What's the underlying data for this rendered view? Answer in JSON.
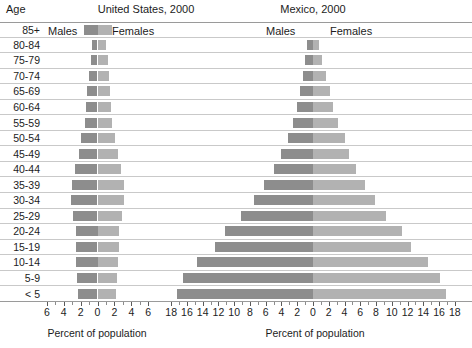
{
  "header": {
    "age_axis_label": "Age",
    "us_title": "United States, 2000",
    "mx_title": "Mexico, 2000",
    "legend": {
      "us_males": "Males",
      "us_females": "Females",
      "mx_males": "Males",
      "mx_females": "Females"
    }
  },
  "footer": {
    "us_caption": "Percent of population",
    "mx_caption": "Percent of population"
  },
  "chart_data": {
    "type": "bar",
    "subtype": "population-pyramid",
    "xlabel": "Percent of population",
    "ylabel": "Age",
    "grid": true,
    "legend_position": "top",
    "categories": [
      "85+",
      "80-84",
      "75-79",
      "70-74",
      "65-69",
      "60-64",
      "55-59",
      "50-54",
      "45-49",
      "40-44",
      "35-39",
      "30-34",
      "25-29",
      "20-24",
      "15-19",
      "10-14",
      "5-9",
      "< 5"
    ],
    "panels": [
      {
        "name": "United States, 2000",
        "xlim": [
          -7,
          7
        ],
        "xticks": [
          -6,
          -4,
          -2,
          0,
          2,
          4,
          6
        ],
        "xticklabels": [
          "6",
          "4",
          "2",
          "0",
          "2",
          "4",
          "6"
        ],
        "series": [
          {
            "name": "Males",
            "side": "left",
            "color": "#8d8d8d",
            "values": [
              0.0,
              0.6,
              0.8,
              1.0,
              1.2,
              1.4,
              1.5,
              1.9,
              2.2,
              2.7,
              3.0,
              3.1,
              2.9,
              2.5,
              2.6,
              2.5,
              2.4,
              2.3
            ]
          },
          {
            "name": "Females",
            "side": "right",
            "color": "#b2b2b2",
            "values": [
              0.0,
              1.0,
              1.3,
              1.4,
              1.5,
              1.6,
              1.7,
              2.1,
              2.4,
              2.8,
              3.1,
              3.1,
              2.9,
              2.5,
              2.5,
              2.4,
              2.3,
              2.2
            ]
          }
        ]
      },
      {
        "name": "Mexico, 2000",
        "xlim": [
          -19,
          19
        ],
        "xticks": [
          -18,
          -16,
          -14,
          -12,
          -10,
          -8,
          -6,
          -4,
          -2,
          0,
          2,
          4,
          6,
          8,
          10,
          12,
          14,
          16,
          18
        ],
        "xticklabels": [
          "18",
          "16",
          "14",
          "12",
          "10",
          "8",
          "6",
          "4",
          "2",
          "0",
          "2",
          "4",
          "6",
          "8",
          "10",
          "12",
          "14",
          "16",
          "18"
        ],
        "series": [
          {
            "name": "Males",
            "side": "left",
            "color": "#8d8d8d",
            "values": [
              0.0,
              0.7,
              1.0,
              1.3,
              1.7,
              2.0,
              2.6,
              3.2,
              4.0,
              4.9,
              6.2,
              7.5,
              9.2,
              11.2,
              12.5,
              14.7,
              16.5,
              17.3
            ]
          },
          {
            "name": "Females",
            "side": "right",
            "color": "#b2b2b2",
            "values": [
              0.0,
              0.8,
              1.2,
              1.6,
              2.1,
              2.6,
              3.2,
              4.0,
              4.6,
              5.4,
              6.6,
              7.9,
              9.3,
              11.3,
              12.4,
              14.6,
              16.1,
              16.9
            ]
          }
        ]
      }
    ]
  }
}
